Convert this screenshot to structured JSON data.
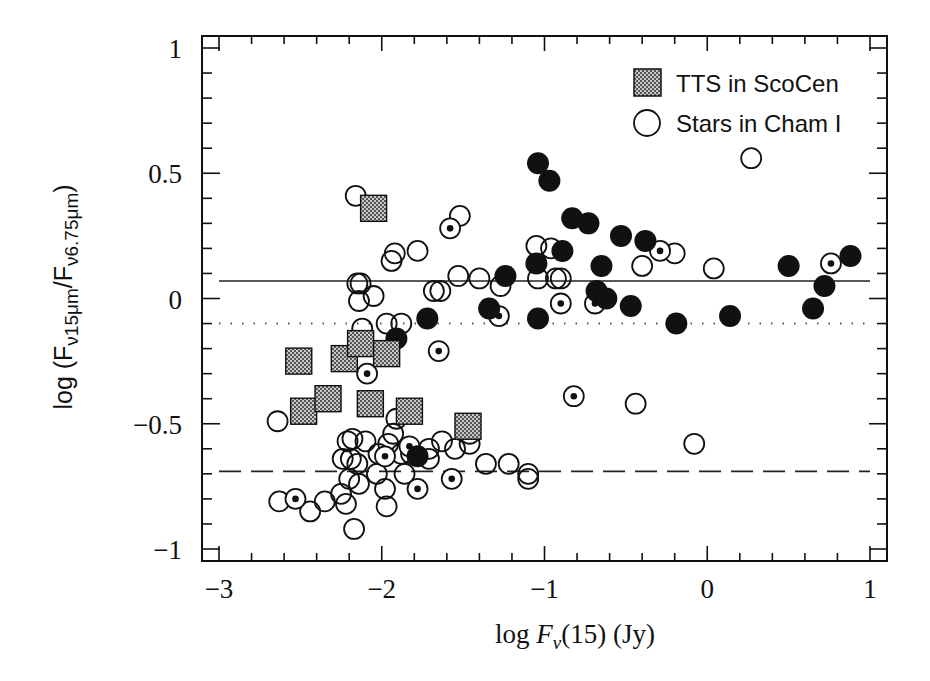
{
  "chart_data": {
    "type": "scatter",
    "title": "",
    "xlabel": "log F_ν(15) (Jy)",
    "ylabel": "log (F_ν15μm / F_ν6.75μm)",
    "xlim": [
      -3.1,
      1.1
    ],
    "ylim": [
      -1.05,
      1.05
    ],
    "xticks": [
      -3,
      -2,
      -1,
      0,
      1
    ],
    "xtick_labels": [
      "−3",
      "−2",
      "−1",
      "0",
      "1"
    ],
    "yticks": [
      1,
      0.5,
      0,
      -0.5,
      -1
    ],
    "ytick_labels": [
      "1",
      "0.5",
      "0",
      "−0.5",
      "−1"
    ],
    "grid": false,
    "legend_position": "upper right",
    "legend": [
      {
        "label": "TTS in ScoCen",
        "marker": "hatched-square"
      },
      {
        "label": "Stars in Cham I",
        "marker": "open-circle"
      }
    ],
    "reference_lines": [
      {
        "style": "solid",
        "y": 0.07,
        "x_range": [
          -3,
          1
        ]
      },
      {
        "style": "dotted",
        "y": -0.1,
        "x_range": [
          -3,
          1
        ]
      },
      {
        "style": "dashed",
        "y": -0.69,
        "x_range": [
          -3,
          1
        ]
      }
    ],
    "series": [
      {
        "name": "TTS in ScoCen",
        "marker": "hatched-square",
        "points": [
          [
            -2.05,
            0.36
          ],
          [
            -2.51,
            -0.25
          ],
          [
            -2.48,
            -0.45
          ],
          [
            -2.33,
            -0.4
          ],
          [
            -2.23,
            -0.24
          ],
          [
            -2.13,
            -0.18
          ],
          [
            -2.07,
            -0.42
          ],
          [
            -1.97,
            -0.22
          ],
          [
            -1.83,
            -0.45
          ],
          [
            -1.47,
            -0.51
          ]
        ]
      },
      {
        "name": "Stars in Cham I (open)",
        "marker": "open-circle",
        "points": [
          [
            -2.16,
            0.41
          ],
          [
            -1.92,
            0.18
          ],
          [
            -1.94,
            0.15
          ],
          [
            -1.78,
            0.19
          ],
          [
            -1.52,
            0.33
          ],
          [
            -2.15,
            0.06
          ],
          [
            -2.13,
            0.06
          ],
          [
            -2.14,
            -0.01
          ],
          [
            -2.05,
            0.01
          ],
          [
            -1.68,
            0.03
          ],
          [
            -1.64,
            0.03
          ],
          [
            -1.53,
            0.09
          ],
          [
            -1.4,
            0.08
          ],
          [
            -1.05,
            0.21
          ],
          [
            -0.96,
            0.2
          ],
          [
            -1.27,
            0.05
          ],
          [
            -1.04,
            0.08
          ],
          [
            -0.93,
            0.08
          ],
          [
            -0.9,
            0.08
          ],
          [
            -0.4,
            0.13
          ],
          [
            -0.2,
            0.18
          ],
          [
            0.04,
            0.12
          ],
          [
            0.27,
            0.56
          ],
          [
            -2.12,
            -0.12
          ],
          [
            -1.97,
            -0.1
          ],
          [
            -1.88,
            -0.1
          ],
          [
            -2.64,
            -0.49
          ],
          [
            -2.21,
            -0.57
          ],
          [
            -2.18,
            -0.56
          ],
          [
            -2.1,
            -0.57
          ],
          [
            -2.02,
            -0.62
          ],
          [
            -1.96,
            -0.58
          ],
          [
            -1.93,
            -0.54
          ],
          [
            -1.88,
            -0.62
          ],
          [
            -1.71,
            -0.6
          ],
          [
            -1.63,
            -0.57
          ],
          [
            -1.55,
            -0.6
          ],
          [
            -1.46,
            -0.54
          ],
          [
            -1.46,
            -0.58
          ],
          [
            -1.36,
            -0.66
          ],
          [
            -1.22,
            -0.66
          ],
          [
            -1.1,
            -0.7
          ],
          [
            -1.1,
            -0.72
          ],
          [
            -2.24,
            -0.64
          ],
          [
            -2.19,
            -0.64
          ],
          [
            -2.15,
            -0.66
          ],
          [
            -2.2,
            -0.72
          ],
          [
            -2.14,
            -0.74
          ],
          [
            -2.03,
            -0.7
          ],
          [
            -1.86,
            -0.7
          ],
          [
            -1.82,
            -0.62
          ],
          [
            -1.98,
            -0.76
          ],
          [
            -1.97,
            -0.83
          ],
          [
            -2.63,
            -0.81
          ],
          [
            -2.44,
            -0.85
          ],
          [
            -2.35,
            -0.81
          ],
          [
            -2.25,
            -0.78
          ],
          [
            -2.22,
            -0.82
          ],
          [
            -2.17,
            -0.92
          ],
          [
            -1.71,
            -0.64
          ],
          [
            -1.91,
            -0.48
          ],
          [
            -0.44,
            -0.42
          ],
          [
            -0.08,
            -0.58
          ]
        ]
      },
      {
        "name": "Stars in Cham I (dotted)",
        "marker": "dotted-circle",
        "points": [
          [
            -1.58,
            0.28
          ],
          [
            -2.09,
            -0.3
          ],
          [
            -1.65,
            -0.21
          ],
          [
            -1.28,
            -0.07
          ],
          [
            -0.9,
            -0.02
          ],
          [
            -0.69,
            -0.02
          ],
          [
            -0.29,
            0.19
          ],
          [
            0.76,
            0.14
          ],
          [
            -0.82,
            -0.39
          ],
          [
            -2.53,
            -0.8
          ],
          [
            -1.78,
            -0.76
          ],
          [
            -1.57,
            -0.72
          ],
          [
            -1.83,
            -0.59
          ],
          [
            -1.98,
            -0.63
          ]
        ]
      },
      {
        "name": "Stars in Cham I (filled)",
        "marker": "filled-circle",
        "points": [
          [
            -1.04,
            0.54
          ],
          [
            -0.97,
            0.47
          ],
          [
            -0.83,
            0.32
          ],
          [
            -0.73,
            0.3
          ],
          [
            -0.89,
            0.19
          ],
          [
            -1.05,
            0.14
          ],
          [
            -1.24,
            0.09
          ],
          [
            -0.53,
            0.25
          ],
          [
            -0.38,
            0.23
          ],
          [
            -0.65,
            0.13
          ],
          [
            -0.68,
            0.03
          ],
          [
            -0.62,
            0.0
          ],
          [
            -0.47,
            -0.03
          ],
          [
            -1.34,
            -0.04
          ],
          [
            -1.72,
            -0.08
          ],
          [
            -1.04,
            -0.08
          ],
          [
            -0.19,
            -0.1
          ],
          [
            0.14,
            -0.07
          ],
          [
            0.5,
            0.13
          ],
          [
            0.65,
            -0.04
          ],
          [
            0.72,
            0.05
          ],
          [
            0.88,
            0.17
          ],
          [
            -1.91,
            -0.16
          ],
          [
            -1.78,
            -0.63
          ]
        ]
      }
    ]
  }
}
